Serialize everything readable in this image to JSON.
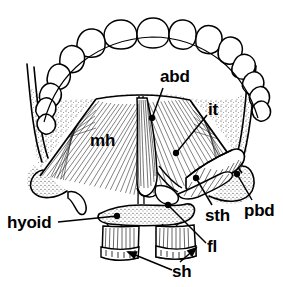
{
  "figure": {
    "style": "black-and-white anatomical line drawing",
    "colors": {
      "ink": "#000000",
      "background": "#ffffff"
    }
  },
  "labels": [
    {
      "id": "abd",
      "text": "abd",
      "meaning": "anterior belly of digastric",
      "x": 160,
      "y": 68,
      "size": 17,
      "leader": {
        "from": [
          163,
          88
        ],
        "to": [
          152,
          118
        ],
        "marker": "dot"
      }
    },
    {
      "id": "it",
      "text": "it",
      "meaning": "intermediate tendon",
      "x": 208,
      "y": 101,
      "size": 17,
      "leader": {
        "from": [
          207,
          115
        ],
        "to": [
          176,
          153
        ],
        "marker": "dot"
      }
    },
    {
      "id": "mh",
      "text": "mh",
      "meaning": "mylohyoid",
      "x": 90,
      "y": 132,
      "size": 17,
      "leader": null
    },
    {
      "id": "pbd",
      "text": "pbd",
      "meaning": "posterior belly of digastric",
      "x": 244,
      "y": 202,
      "size": 17,
      "leader": {
        "from": [
          252,
          200
        ],
        "to": [
          237,
          174
        ],
        "marker": "dot"
      }
    },
    {
      "id": "sth",
      "text": "sth",
      "meaning": "stylohyoid",
      "x": 205,
      "y": 207,
      "size": 17,
      "leader": {
        "from": [
          212,
          205
        ],
        "to": [
          196,
          178
        ],
        "marker": "dot"
      }
    },
    {
      "id": "fl",
      "text": "fl",
      "meaning": "fibrous loop",
      "x": 207,
      "y": 238,
      "size": 17,
      "leader": {
        "from": [
          206,
          243
        ],
        "to": [
          168,
          205
        ],
        "marker": "dot"
      }
    },
    {
      "id": "hyoid",
      "text": "hyoid",
      "meaning": "hyoid bone",
      "x": 7,
      "y": 214,
      "size": 17,
      "leader": {
        "from": [
          58,
          222
        ],
        "to": [
          117,
          216
        ],
        "marker": "dot"
      }
    },
    {
      "id": "sh",
      "text": "sh",
      "meaning": "sternohyoid",
      "x": 172,
      "y": 263,
      "size": 17,
      "leaders": [
        {
          "from": [
            172,
            270
          ],
          "to": [
            128,
            252
          ],
          "marker": "arrow"
        },
        {
          "from": [
            180,
            262
          ],
          "to": [
            196,
            248
          ],
          "marker": "arrow"
        }
      ]
    }
  ],
  "structures": [
    {
      "name": "mandible-dental-arch",
      "description": "row of teeth forming the anterior dental arcade"
    },
    {
      "name": "mandible-body",
      "description": "stippled bone of the mandible on each side"
    },
    {
      "name": "mylohyoid-muscle",
      "description": "broad fan of fine oblique fibers forming the floor of mouth"
    },
    {
      "name": "mylohyoid-raphe",
      "description": "midline vertical raphe"
    },
    {
      "name": "anterior-belly-digastric",
      "description": "paired midline strap muscle with longitudinal fibers"
    },
    {
      "name": "intermediate-tendon",
      "description": "tendon passing through the fibrous loop at the hyoid"
    },
    {
      "name": "posterior-belly-digastric",
      "description": "hatched tubular muscle running posterolaterally"
    },
    {
      "name": "stylohyoid-muscle",
      "description": "slender muscle accompanying the posterior belly"
    },
    {
      "name": "hyoid-bone",
      "description": "stippled transverse bone below the mylohyoid"
    },
    {
      "name": "sternohyoid-muscles",
      "description": "paired vertical striated muscles with cut inferior ends"
    }
  ]
}
